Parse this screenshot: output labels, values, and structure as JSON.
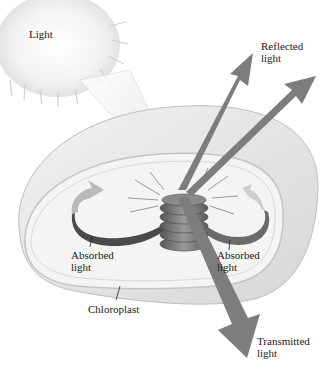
{
  "diagram": {
    "type": "chloroplast light interaction illustration",
    "labels": {
      "light": "Light",
      "reflected": "Reflected\nlight",
      "absorbed_left": "Absorbed\nlight",
      "absorbed_right": "Absorbed\nlight",
      "chloroplast": "Chloroplast",
      "transmitted": "Transmitted\nlight"
    },
    "colors": {
      "arrow": "#7a7a7a",
      "shell": "#e6e6e6",
      "shell_edge": "#bdbdbd",
      "inner": "#f2f2f2",
      "granum": "#6e6e6e",
      "ribbon_dark": "#4a4a4a",
      "sun": "#f4f4f4"
    }
  }
}
